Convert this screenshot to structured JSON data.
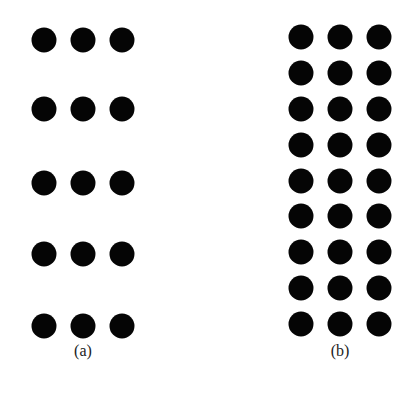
{
  "panels": [
    {
      "id": "a",
      "caption": "(a)",
      "caption_pos": {
        "x": 83,
        "y": 342
      },
      "columns_x": [
        44,
        83,
        122
      ],
      "rows_y": [
        40,
        109,
        183,
        254,
        326
      ],
      "dot_color": "#050505"
    },
    {
      "id": "b",
      "caption": "(b)",
      "caption_pos": {
        "x": 340,
        "y": 342
      },
      "columns_x": [
        301,
        340,
        379
      ],
      "rows_y": [
        37,
        73,
        109,
        145,
        181,
        216,
        252,
        288,
        324
      ],
      "dot_color": "#050505"
    }
  ]
}
